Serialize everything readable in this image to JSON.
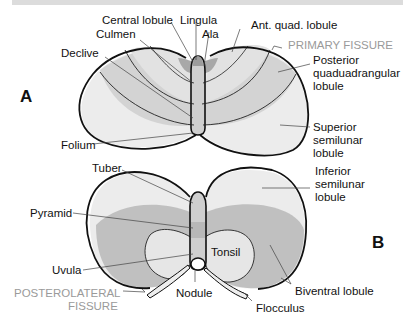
{
  "figure": {
    "panels": [
      {
        "id": "A",
        "letter": "A",
        "view": "superior",
        "labels": {
          "central_lobule": "Central lobule",
          "lingula": "Lingula",
          "culmen": "Culmen",
          "ala": "Ala",
          "ant_quad": "Ant. quad. lobule",
          "primary_fissure": "PRIMARY FISSURE",
          "declive": "Declive",
          "posterior_1": "Posterior",
          "posterior_2": "quaduadrangular",
          "posterior_3": "lobule",
          "folium": "Folium",
          "superior_1": "Superior",
          "superior_2": "semilunar",
          "superior_3": "lobule"
        }
      },
      {
        "id": "B",
        "letter": "B",
        "view": "inferior",
        "labels": {
          "tuber": "Tuber",
          "inferior_1": "Inferior",
          "inferior_2": "semilunar",
          "inferior_3": "lobule",
          "pyramid": "Pyramid",
          "tonsil": "Tonsil",
          "uvula": "Uvula",
          "posterolateral_1": "POSTEROLATERAL",
          "posterolateral_2": "FISSURE",
          "nodule": "Nodule",
          "biventral": "Biventral lobule",
          "flocculus": "Flocculus"
        }
      }
    ],
    "colors": {
      "light": "#e9e9e9",
      "mid": "#d2d2d2",
      "dark": "#b8b8b8",
      "darkest": "#a6a6a6",
      "outline": "#111111",
      "fissure_label": "#9a9a9a"
    }
  }
}
